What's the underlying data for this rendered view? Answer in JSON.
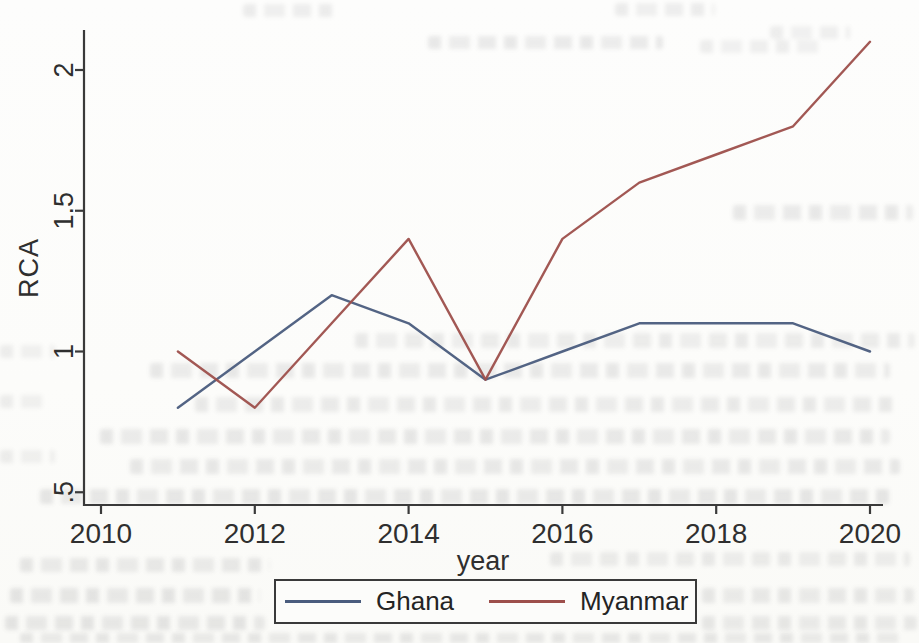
{
  "figure": {
    "kind": "scanned-stata-line-figure",
    "background_color": "#fdfdfb",
    "axis_color": "#3a3a3a",
    "text_color": "#2f2f2f"
  },
  "chart_data": {
    "type": "line",
    "title": "",
    "xlabel": "year",
    "ylabel": "RCA",
    "x": [
      2011,
      2012,
      2013,
      2014,
      2015,
      2016,
      2017,
      2018,
      2019,
      2020
    ],
    "series": [
      {
        "name": "Ghana",
        "color": "#4a5c7d",
        "values": [
          0.8,
          1.0,
          1.2,
          1.1,
          0.9,
          1.0,
          1.1,
          1.1,
          1.1,
          1.0
        ]
      },
      {
        "name": "Myanmar",
        "color": "#9d4f4b",
        "values": [
          1.0,
          0.8,
          1.1,
          1.4,
          0.9,
          1.4,
          1.6,
          1.7,
          1.8,
          2.1
        ]
      }
    ],
    "x_ticks": [
      {
        "v": 2010,
        "label": "2010"
      },
      {
        "v": 2012,
        "label": "2012"
      },
      {
        "v": 2014,
        "label": "2014"
      },
      {
        "v": 2016,
        "label": "2016"
      },
      {
        "v": 2018,
        "label": "2018"
      },
      {
        "v": 2020,
        "label": "2020"
      }
    ],
    "y_ticks": [
      {
        "v": 0.5,
        "label": ".5"
      },
      {
        "v": 1.0,
        "label": "1"
      },
      {
        "v": 1.5,
        "label": "1.5"
      },
      {
        "v": 2.0,
        "label": "2"
      }
    ],
    "xlim": [
      2009.8,
      2020.2
    ],
    "ylim": [
      0.45,
      2.2
    ],
    "grid": false,
    "y_tick_label_angle": 90,
    "legend_position": "bottom-center"
  }
}
